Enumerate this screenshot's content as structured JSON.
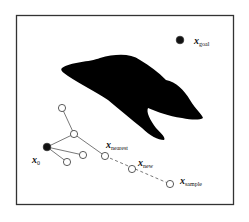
{
  "diagram": {
    "colors": {
      "background": "#ffffff",
      "frame": "#333333",
      "obstacle": "#000000",
      "node_fill_open": "#ffffff",
      "node_fill_start": "#111111",
      "edge": "#555555"
    },
    "frame": {
      "x": 16,
      "y": 15,
      "width": 217,
      "height": 189
    },
    "labels": {
      "goal": {
        "base": "x",
        "sub": "goal"
      },
      "start": {
        "base": "x",
        "sub": "0"
      },
      "nearest": {
        "base": "x",
        "sub": "nearest"
      },
      "new": {
        "base": "x",
        "sub": "new"
      },
      "sample": {
        "base": "x",
        "sub": "sample"
      }
    },
    "nodes": [
      {
        "id": "x_goal",
        "x": 180,
        "y": 40,
        "filled": true
      },
      {
        "id": "x_0",
        "x": 47,
        "y": 147,
        "filled": true
      },
      {
        "id": "n1",
        "x": 62,
        "y": 108,
        "filled": false
      },
      {
        "id": "n2",
        "x": 74,
        "y": 134,
        "filled": false
      },
      {
        "id": "n3",
        "x": 83,
        "y": 155,
        "filled": false
      },
      {
        "id": "n4",
        "x": 67,
        "y": 162,
        "filled": false
      },
      {
        "id": "x_nearest",
        "x": 105,
        "y": 156,
        "filled": false
      },
      {
        "id": "x_new",
        "x": 132,
        "y": 169,
        "filled": false
      },
      {
        "id": "x_sample",
        "x": 170,
        "y": 184,
        "filled": false
      }
    ],
    "edges": [
      {
        "from": "x_0",
        "to": "n2",
        "style": "solid"
      },
      {
        "from": "x_0",
        "to": "n3",
        "style": "solid"
      },
      {
        "from": "x_0",
        "to": "n4",
        "style": "solid"
      },
      {
        "from": "n2",
        "to": "n1",
        "style": "solid"
      },
      {
        "from": "n2",
        "to": "x_nearest",
        "style": "solid"
      },
      {
        "from": "x_nearest",
        "to": "x_sample",
        "style": "dashed"
      }
    ],
    "caption": ""
  }
}
